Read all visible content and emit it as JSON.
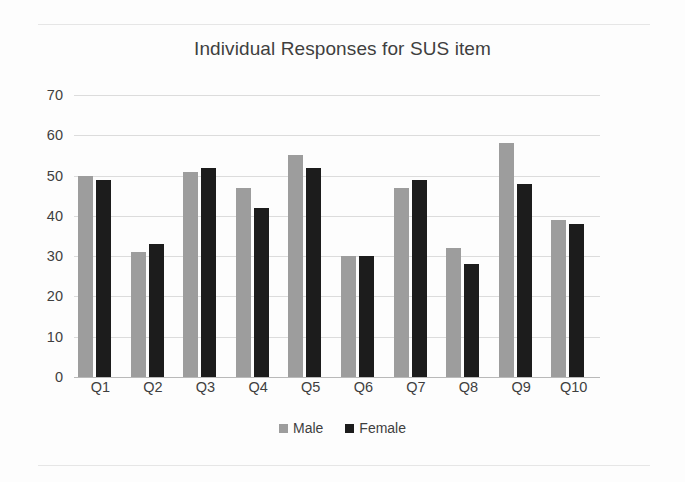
{
  "chart_data": {
    "type": "bar",
    "title": "Individual Responses for SUS item",
    "xlabel": "",
    "ylabel": "",
    "ylim": [
      0,
      70
    ],
    "yticks": [
      0,
      10,
      20,
      30,
      40,
      50,
      60,
      70
    ],
    "grid": true,
    "legend_position": "bottom",
    "categories": [
      "Q1",
      "Q2",
      "Q3",
      "Q4",
      "Q5",
      "Q6",
      "Q7",
      "Q8",
      "Q9",
      "Q10"
    ],
    "series": [
      {
        "name": "Male",
        "color": "#9d9d9d",
        "values": [
          50,
          31,
          51,
          47,
          55,
          30,
          47,
          32,
          58,
          39
        ]
      },
      {
        "name": "Female",
        "color": "#1c1c1c",
        "values": [
          49,
          33,
          52,
          42,
          52,
          30,
          49,
          28,
          48,
          38
        ]
      }
    ]
  }
}
